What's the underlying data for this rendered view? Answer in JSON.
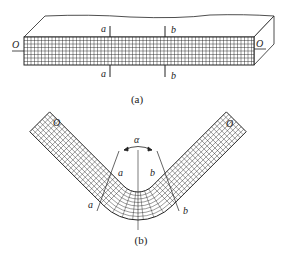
{
  "figure_a": {
    "caption": "(a)",
    "labels": {
      "axis_left": "O",
      "axis_right": "O",
      "section_a_top": "a",
      "section_a_bottom": "a",
      "section_b_top": "b",
      "section_b_bottom": "b"
    },
    "description": "Straight beam with grid on front face, sections a-a and b-b"
  },
  "figure_b": {
    "caption": "(b)",
    "labels": {
      "axis_left": "O",
      "axis_right": "O",
      "angle": "α",
      "section_a_inner": "a",
      "section_b_inner": "b",
      "section_a_outer": "a",
      "section_b_outer": "b"
    },
    "description": "Beam bent into V shape; grid lines show deformation; angle α between sections"
  },
  "colors": {
    "line": "#222222",
    "background": "#ffffff"
  }
}
